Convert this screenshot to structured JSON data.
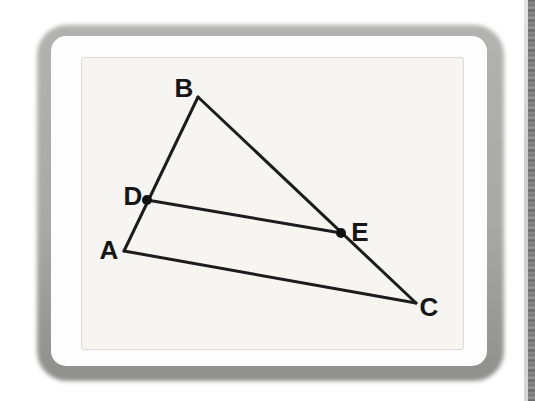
{
  "figure": {
    "type": "geometry-diagram",
    "line_color": "#1c1c1c",
    "line_width": 3,
    "dot_radius": 5,
    "dot_color": "#111111",
    "vertices": {
      "A": [
        124,
        251
      ],
      "B": [
        198,
        97
      ],
      "C": [
        416,
        303
      ]
    },
    "points_on_sides": {
      "D": [
        147,
        200
      ],
      "E": [
        341,
        233
      ]
    },
    "segments": [
      [
        "A",
        "B"
      ],
      [
        "B",
        "C"
      ],
      [
        "A",
        "C"
      ],
      [
        "D",
        "E"
      ]
    ],
    "labels": {
      "A": "A",
      "B": "B",
      "C": "C",
      "D": "D",
      "E": "E"
    },
    "label_positions": {
      "A": [
        109,
        250
      ],
      "B": [
        184,
        88
      ],
      "C": [
        429,
        307
      ],
      "D": [
        133,
        196
      ],
      "E": [
        360,
        232
      ]
    }
  },
  "colors": {
    "page_bg": "#ffffff",
    "photo_border_gray": "#a9a9a8",
    "bezel_white": "#fdfdfd",
    "panel_bg": "#f6f5f2",
    "panel_border": "#dcdad3",
    "edge_band_dark": "#6a6a6a",
    "edge_band_light": "#d2d2d2"
  }
}
